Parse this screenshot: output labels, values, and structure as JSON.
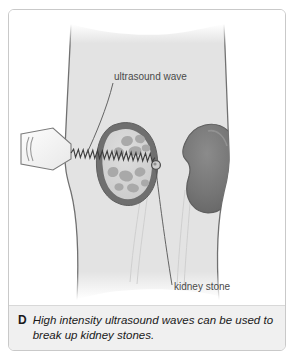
{
  "figure": {
    "caption_letter": "D",
    "caption_text": "High intensity ultrasound waves can be used to break up kidney stones.",
    "labels": {
      "ultrasound_wave": "ultrasound wave",
      "kidney_stone": "kidney stone"
    },
    "icons": {
      "transducer": "ultrasound-transducer-icon",
      "wave": "ultrasound-wave-icon",
      "stone": "kidney-stone-icon"
    },
    "colors": {
      "panel_border": "#c9c9c9",
      "caption_background": "#f0f0f0",
      "body_fill": "#e3e3e3",
      "body_outline": "#5a5a5a",
      "kidney_dark": "#6f6f6f",
      "kidney_light": "#d6d6d6",
      "kidney_outline": "#6b6b6b",
      "kidney_lobule": "#a9a9a9",
      "leader_line": "#555555",
      "label_text": "#4a4a4a",
      "ureter": "#cfcfcf"
    }
  }
}
